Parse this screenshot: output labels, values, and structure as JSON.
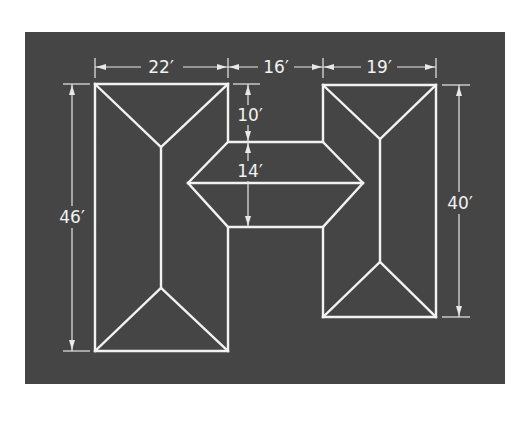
{
  "diagram": {
    "colors": {
      "background": "#454545",
      "lines": "#f2f2f2",
      "page": "#ffffff"
    },
    "dimensions": {
      "left_width": "22′",
      "middle_width": "16′",
      "right_width": "19′",
      "left_height": "46′",
      "right_height": "40′",
      "notch_top": "10′",
      "middle_depth": "14′"
    },
    "sections": [
      {
        "name": "left-wing",
        "width_ft": 22,
        "length_ft": 46
      },
      {
        "name": "connector",
        "width_ft": 16,
        "depth_ft": 14,
        "offset_ft": 10
      },
      {
        "name": "right-wing",
        "width_ft": 19,
        "length_ft": 40
      }
    ]
  }
}
